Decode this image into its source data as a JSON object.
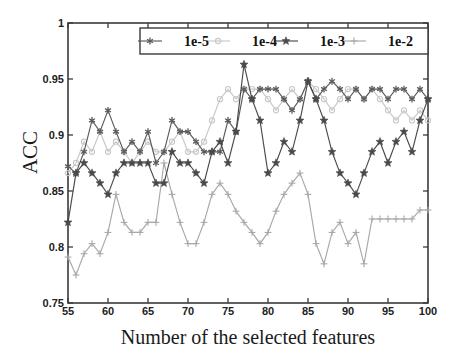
{
  "chart_data": {
    "type": "line",
    "title": "",
    "xlabel": "Number of the selected features",
    "ylabel": "ACC",
    "xlim": [
      55,
      100
    ],
    "ylim": [
      0.75,
      1
    ],
    "xticks": [
      55,
      60,
      65,
      70,
      75,
      80,
      85,
      90,
      95,
      100
    ],
    "yticks": [
      0.75,
      0.8,
      0.85,
      0.9,
      0.95,
      1
    ],
    "xtick_labels": [
      "55",
      "60",
      "65",
      "70",
      "75",
      "80",
      "85",
      "90",
      "95",
      "100"
    ],
    "ytick_labels": [
      "0.75",
      "0.8",
      "0.85",
      "0.9",
      "0.95",
      "1"
    ],
    "grid": false,
    "legend_position": "top-center",
    "box": true,
    "x": [
      55,
      56,
      57,
      58,
      59,
      60,
      61,
      62,
      63,
      64,
      65,
      66,
      67,
      68,
      69,
      70,
      71,
      72,
      73,
      74,
      75,
      76,
      77,
      78,
      79,
      80,
      81,
      82,
      83,
      84,
      85,
      86,
      87,
      88,
      89,
      90,
      91,
      92,
      93,
      94,
      95,
      96,
      97,
      98,
      99,
      100
    ],
    "series": [
      {
        "name": "1e-5",
        "color": "#5a5a5a",
        "marker": "asterisk",
        "values": [
          0.872,
          0.866,
          0.885,
          0.913,
          0.903,
          0.922,
          0.903,
          0.885,
          0.894,
          0.885,
          0.903,
          0.875,
          0.885,
          0.913,
          0.903,
          0.903,
          0.894,
          0.885,
          0.885,
          0.885,
          0.913,
          0.903,
          0.941,
          0.932,
          0.941,
          0.941,
          0.941,
          0.932,
          0.922,
          0.932,
          0.948,
          0.932,
          0.941,
          0.948,
          0.941,
          0.932,
          0.941,
          0.932,
          0.941,
          0.941,
          0.932,
          0.941,
          0.941,
          0.932,
          0.941,
          0.932
        ]
      },
      {
        "name": "1e-4",
        "color": "#c8c8c8",
        "marker": "circle",
        "values": [
          0.866,
          0.875,
          0.894,
          0.885,
          0.903,
          0.885,
          0.894,
          0.885,
          0.875,
          0.885,
          0.894,
          0.885,
          0.885,
          0.894,
          0.903,
          0.885,
          0.885,
          0.894,
          0.913,
          0.932,
          0.941,
          0.932,
          0.941,
          0.941,
          0.941,
          0.932,
          0.922,
          0.932,
          0.941,
          0.932,
          0.948,
          0.941,
          0.932,
          0.922,
          0.932,
          0.941,
          0.941,
          0.932,
          0.941,
          0.932,
          0.922,
          0.913,
          0.922,
          0.913,
          0.922,
          0.913
        ]
      },
      {
        "name": "1e-3",
        "color": "#4a4a4a",
        "marker": "star",
        "values": [
          0.822,
          0.866,
          0.875,
          0.866,
          0.857,
          0.847,
          0.866,
          0.875,
          0.875,
          0.875,
          0.875,
          0.857,
          0.857,
          0.885,
          0.875,
          0.875,
          0.866,
          0.857,
          0.885,
          0.894,
          0.875,
          0.903,
          0.963,
          0.932,
          0.913,
          0.866,
          0.875,
          0.894,
          0.885,
          0.913,
          0.948,
          0.932,
          0.913,
          0.885,
          0.866,
          0.857,
          0.847,
          0.866,
          0.885,
          0.894,
          0.875,
          0.894,
          0.903,
          0.885,
          0.913,
          0.932
        ]
      },
      {
        "name": "1e-2",
        "color": "#a8a8a8",
        "marker": "plus",
        "values": [
          0.791,
          0.775,
          0.794,
          0.803,
          0.794,
          0.813,
          0.847,
          0.822,
          0.813,
          0.813,
          0.822,
          0.822,
          0.875,
          0.847,
          0.822,
          0.803,
          0.803,
          0.822,
          0.847,
          0.857,
          0.847,
          0.832,
          0.822,
          0.813,
          0.803,
          0.813,
          0.832,
          0.847,
          0.857,
          0.866,
          0.847,
          0.803,
          0.785,
          0.813,
          0.822,
          0.803,
          0.813,
          0.785,
          0.825,
          0.825,
          0.825,
          0.825,
          0.825,
          0.825,
          0.833,
          0.833
        ]
      }
    ]
  },
  "legend": {
    "entries": [
      {
        "label": "1e-5"
      },
      {
        "label": "1e-4"
      },
      {
        "label": "1e-3"
      },
      {
        "label": "1e-2"
      }
    ]
  },
  "axis": {
    "x_label": "Number of the selected features",
    "y_label": "ACC"
  }
}
